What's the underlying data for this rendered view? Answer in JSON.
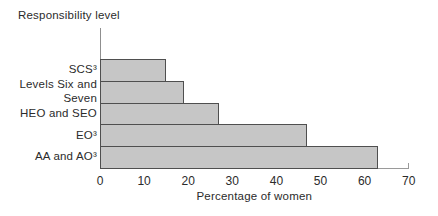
{
  "chart_data": {
    "type": "bar",
    "orientation": "horizontal",
    "y_axis_title": "Responsibility level",
    "xlabel": "Percentage of women",
    "categories": [
      "SCS³",
      "Levels Six and Seven",
      "HEO and SEO",
      "EO³",
      "AA and AO³"
    ],
    "category_label_lines": [
      [
        "SCS³"
      ],
      [
        "Levels Six and",
        "Seven"
      ],
      [
        "HEO and SEO"
      ],
      [
        "EO³"
      ],
      [
        "AA and AO³"
      ]
    ],
    "values": [
      15,
      19,
      27,
      47,
      63
    ],
    "xlim": [
      0,
      70
    ],
    "xticks": [
      0,
      10,
      20,
      30,
      40,
      50,
      60,
      70
    ],
    "grid": false,
    "legend": false,
    "colors": {
      "bar_fill": "#c6c6c6",
      "bar_border": "#4f4f4f",
      "axis_line": "#8f8f8f",
      "text": "#2b2b2b",
      "background": "#ffffff"
    }
  }
}
